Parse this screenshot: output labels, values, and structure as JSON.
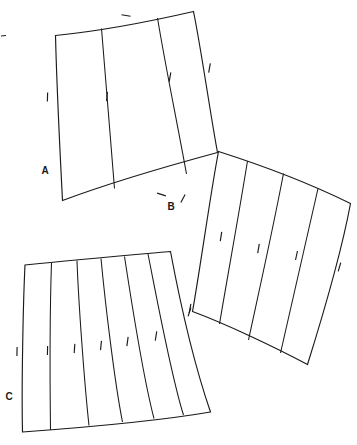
{
  "figure": {
    "background_color": "#ffffff",
    "line_color": "#1a1a1a",
    "canvas": {
      "width": 357,
      "height": 445
    }
  },
  "panels": [
    {
      "id": "A",
      "label": "A",
      "label_position": {
        "x": 45,
        "y": 171
      },
      "segment_count": 3,
      "outline_path": "M 55.5 35.5 C 96 31.5 150 21.5 193.5 11.5 C 201 48 210 112 217.5 152.5 C 175 164 112 182 62.5 200.5 C 60.5 162 56.5 76 55.5 35.5 Z",
      "seam_paths": [
        "M 101.5 28.5 C 105.5 80 110.5 136.5 114.5 188.5",
        "M 157.5 18.0 C 165.5 66.5 177.5 124.5 186.5 174.0"
      ],
      "ticks": [
        {
          "x": 47.5,
          "y": 97.0,
          "angle": 92
        },
        {
          "x": 107.0,
          "y": 96.5,
          "angle": 95
        },
        {
          "x": 126.0,
          "y": 15.5,
          "angle": 10
        },
        {
          "x": 170.0,
          "y": 77.0,
          "angle": 100
        },
        {
          "x": 209.5,
          "y": 68.0,
          "angle": 100
        },
        {
          "x": 161.5,
          "y": 194.5,
          "angle": 18
        }
      ]
    },
    {
      "id": "B",
      "label": "B",
      "label_position": {
        "x": 171,
        "y": 207
      },
      "segment_count": 4,
      "outline_path": "M 218.5 151.5 C 262.5 165.5 314 185.5 350.5 203.5 C 344.5 236 330.5 291 307.5 364.5 C 272 345.5 223.5 323 192.5 311.5 C 200 270 210.5 193 218.5 151.5 Z",
      "seam_paths": [
        "M 247.5 161.0 C 238.5 216.5 228.0 273.5 219.5 324.0",
        "M 283.5 173.5 C 272.5 231.0 259.5 289.0 248.5 340.0",
        "M 318.0 188.5 C 305.5 245.5 292.5 300.0 280.5 353.0"
      ],
      "ticks": [
        {
          "x": 183.0,
          "y": 198.5,
          "angle": 118
        },
        {
          "x": 221.0,
          "y": 236.5,
          "angle": 99
        },
        {
          "x": 258.5,
          "y": 248.5,
          "angle": 100
        },
        {
          "x": 296.5,
          "y": 255.5,
          "angle": 102
        },
        {
          "x": 339.5,
          "y": 267.0,
          "angle": 106
        },
        {
          "x": 190.0,
          "y": 308.5,
          "angle": 101
        }
      ]
    },
    {
      "id": "C",
      "label": "C",
      "label_position": {
        "x": 9,
        "y": 397
      },
      "segment_count": 6,
      "outline_path": "M 25.0 265.0 C 77.5 259.5 130.5 255.0 170.5 251.5 C 176.5 283.5 191 355.5 210.5 412.0 C 155.5 421.5 77.5 428.0 22.5 432.0 C 21.5 390.5 23.0 306.0 25.0 265.0 Z",
      "seam_paths": [
        "M 51.5 263.0 C 50.0 305.5 50.0 388.0 50.5 430.0",
        "M 77.0 260.5 C 78.5 303.0 84.5 384.5 89.0 425.5",
        "M 101.0 258.5 C 105.0 301.0 114.5 382.0 122.5 422.0",
        "M 124.5 256.5 C 131.0 299.0 143.5 379.0 154.0 418.5",
        "M 148.0 254.0 C 156.5 296.5 171.0 375.5 183.5 415.0"
      ],
      "ticks": [
        {
          "x": 17.0,
          "y": 351.5,
          "angle": 91
        },
        {
          "x": 47.5,
          "y": 350.5,
          "angle": 91
        },
        {
          "x": 74.5,
          "y": 348.5,
          "angle": 94
        },
        {
          "x": 101.0,
          "y": 345.5,
          "angle": 96
        },
        {
          "x": 127.5,
          "y": 341.5,
          "angle": 98
        },
        {
          "x": 156.0,
          "y": 336.0,
          "angle": 99
        },
        {
          "x": 189.5,
          "y": 312.0,
          "angle": 108
        }
      ]
    }
  ],
  "stray_marks": [
    {
      "path": "M 1.0 36.0 L 6.0 35.5"
    }
  ]
}
